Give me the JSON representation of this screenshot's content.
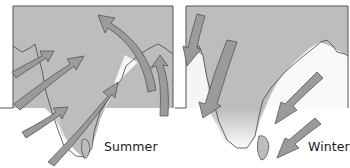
{
  "diagram": {
    "colors": {
      "land": "#bdbdbd",
      "arrow_fill": "#9b9b9b",
      "arrow_stroke": "#555555",
      "frame": "#555555",
      "coast": "#444444"
    },
    "panels": [
      {
        "id": "summer",
        "label": "Summer",
        "arrow_direction": "from southwest toward northeast (onto land)"
      },
      {
        "id": "winter",
        "label": "Winter",
        "arrow_direction": "from northeast toward southwest (off land)"
      }
    ]
  }
}
